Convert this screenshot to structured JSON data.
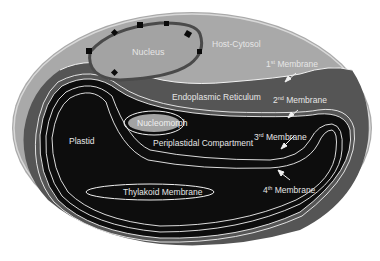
{
  "diagram": {
    "type": "cell-structure",
    "labels": {
      "nucleus": "Nucleus",
      "host_cytosol": "Host-Cytosol",
      "membrane1_num": "1",
      "membrane1_sup": "st",
      "membrane1_word": "Membrane",
      "endoplasmic_reticulum": "Endoplasmic Reticulum",
      "membrane2_num": "2",
      "membrane2_sup": "nd",
      "membrane2_word": "Membrane",
      "nucleomorph": "Nucleomorph",
      "plastid": "Plastid",
      "periplastidal": "Periplastidal Compartment",
      "membrane3_num": "3",
      "membrane3_sup": "rd",
      "membrane3_word": "Membrane",
      "membrane4_num": "4",
      "membrane4_sup": "th",
      "membrane4_word": "Membrane",
      "thylakoid": "Thylakoid Membrane"
    },
    "colors": {
      "background": "#ffffff",
      "cytosol": "#a9a9a9",
      "er": "#555555",
      "plastid": "#0d0d0d",
      "nucleus": "#a3a3a3",
      "membrane_line": "#f2f2f2",
      "pore": "#0a0a0a"
    }
  }
}
